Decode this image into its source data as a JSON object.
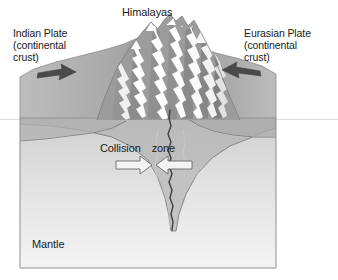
{
  "figure": {
    "title": "Himalayas",
    "background_color": "#ffffff"
  },
  "labels": {
    "himalayas": "Himalayas",
    "indian_plate_line1": "Indian Plate",
    "indian_plate_line2": "(continental",
    "indian_plate_line3": "crust)",
    "eurasian_plate_line1": "Eurasian Plate",
    "eurasian_plate_line2": "(continental",
    "eurasian_plate_line3": "crust)",
    "collision_word": "Collision",
    "zone_word": "zone",
    "mantle": "Mantle"
  },
  "arrows": {
    "left_plate_motion": {
      "name": "indian-plate-motion-arrow",
      "direction": "right",
      "style": "solid",
      "color": "#4a4a4a"
    },
    "right_plate_motion": {
      "name": "eurasian-plate-motion-arrow",
      "direction": "left",
      "style": "solid",
      "color": "#4a4a4a"
    },
    "collision_left": {
      "name": "collision-arrow-left",
      "direction": "right",
      "style": "hollow-outline",
      "color": "#f2f2f2"
    },
    "collision_right": {
      "name": "collision-arrow-right",
      "direction": "left",
      "style": "hollow-outline",
      "color": "#f2f2f2"
    }
  },
  "colors": {
    "crust_face": "#b6b6b6",
    "crust_top": "#b0b0b0",
    "crust_top_shadow": "#9a9a9a",
    "mantle": "#dedede",
    "mantle_deep": "#f0f0f0",
    "mountain_highlight": "#ffffff",
    "mountain_shadow": "#8a8a8a",
    "outline": "#6e6e6e",
    "suture_line": "#3d3d3d",
    "text": "#1a1a1a",
    "horizon_line": "#d4d4d4"
  },
  "layers": [
    {
      "name": "continental-crust",
      "label": "continental crust",
      "fill": "#b6b6b6"
    },
    {
      "name": "mantle",
      "label": "Mantle",
      "fill": "#dedede"
    }
  ]
}
